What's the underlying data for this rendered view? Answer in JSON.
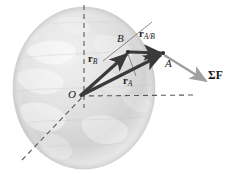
{
  "figure": {
    "background_color": "#ffffff",
    "ink_color": "#1a1a1a",
    "vector_color": "#3a3a3a",
    "force_color": "#9a9a9a",
    "globe_color": "#d8d8d8"
  },
  "points": [
    {
      "key": "origin",
      "label": "O",
      "x": 80,
      "y": 96
    },
    {
      "key": "point_b",
      "label": "B",
      "x": 128,
      "y": 52
    },
    {
      "key": "point_a",
      "label": "A",
      "x": 163,
      "y": 53
    }
  ],
  "vectors": [
    {
      "key": "r_b",
      "symbol": "r",
      "subscript": "B",
      "label": "r_B",
      "from": "O",
      "to": "B",
      "style": "bold-arrow"
    },
    {
      "key": "r_a",
      "symbol": "r",
      "subscript": "A",
      "label": "r_A",
      "from": "O",
      "to": "A",
      "style": "bold-arrow"
    },
    {
      "key": "r_a_b",
      "symbol": "r",
      "subscript": "A/B",
      "label": "r_A/B",
      "from": "B",
      "to": "A",
      "style": "bold-arrow"
    },
    {
      "key": "sum_f",
      "symbol": "ΣF",
      "subscript": "",
      "label": "ΣF",
      "from": "A",
      "to": "force-tip",
      "style": "light-arrow"
    }
  ],
  "axes": [
    {
      "key": "polar-axis",
      "style": "dashed",
      "orientation": "vertical"
    },
    {
      "key": "equatorial-axis",
      "style": "dashed",
      "orientation": "horizontal"
    },
    {
      "key": "oblique-axis",
      "style": "dashed",
      "orientation": "diagonal"
    }
  ],
  "labels": {
    "origin": "O",
    "point_a": "A",
    "point_b": "B",
    "r_a_symbol": "r",
    "r_a_sub": "A",
    "r_b_symbol": "r",
    "r_b_sub": "B",
    "r_ab_symbol": "r",
    "r_ab_sub": "A/B",
    "sum_force": "ΣF"
  }
}
